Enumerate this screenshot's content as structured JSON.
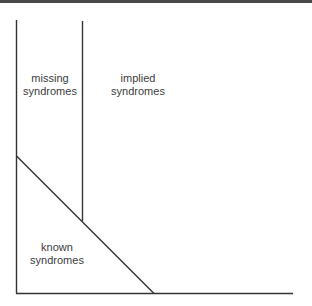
{
  "diagram": {
    "line_color": "#333333",
    "border_color": "#4a4a4a",
    "text_color": "#3c3c3c",
    "regions": [
      {
        "id": "missing",
        "line1": "missing",
        "line2": "syndromes"
      },
      {
        "id": "implied",
        "line1": "implied",
        "line2": "syndromes"
      },
      {
        "id": "known",
        "line1": "known",
        "line2": "syndromes"
      }
    ]
  }
}
